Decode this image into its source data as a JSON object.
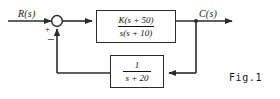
{
  "figure": {
    "caption": "Fig.1",
    "type": "control-system-block-diagram",
    "line_color": "#2b2b2b",
    "background_color": "#ffffff"
  },
  "signals": {
    "input_label": "R(s)",
    "output_label": "C(s)"
  },
  "summing_junction": {
    "input_sign": "+",
    "feedback_sign": "−"
  },
  "forward_block": {
    "numerator": "K(s + 50)",
    "denominator": "s(s + 10)"
  },
  "feedback_block": {
    "numerator": "1",
    "denominator": "s + 20"
  }
}
